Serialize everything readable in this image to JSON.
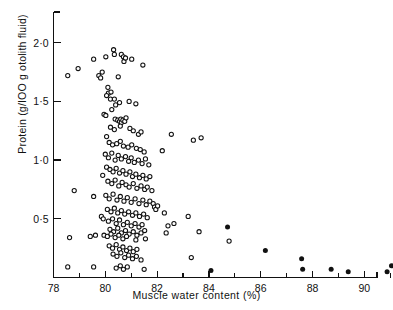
{
  "chart_data": {
    "type": "scatter",
    "title": "",
    "xlabel": "Muscle water content (%)",
    "ylabel": "Protein (g/IOO g otolith fluid)",
    "xlim": [
      78,
      91.3
    ],
    "ylim": [
      0.0,
      2.12
    ],
    "grid": false,
    "legend_position": "none",
    "xticks": [
      78,
      79,
      80,
      81,
      82,
      83,
      84,
      85,
      86,
      87,
      88,
      89,
      90,
      91
    ],
    "xticklabels": [
      "78",
      "",
      "80",
      "",
      "82",
      "",
      "84",
      "",
      "86",
      "",
      "88",
      "",
      "90",
      ""
    ],
    "yticks": [
      0.5,
      1.0,
      1.5,
      2.0
    ],
    "yticklabels": [
      "0·5",
      "1·0",
      "1·5",
      "2·0"
    ],
    "marker_colors": {
      "open": "#111111",
      "filled": "#111111",
      "axis": "#111111"
    },
    "series": [
      {
        "name": "open-circles",
        "marker": "open-circle",
        "points": [
          [
            78.55,
            1.72
          ],
          [
            78.95,
            1.78
          ],
          [
            79.55,
            1.86
          ],
          [
            79.75,
            1.72
          ],
          [
            79.82,
            1.7
          ],
          [
            79.88,
            1.75
          ],
          [
            80.02,
            1.88
          ],
          [
            80.1,
            1.62
          ],
          [
            80.32,
            1.94
          ],
          [
            80.35,
            1.9
          ],
          [
            80.5,
            1.71
          ],
          [
            80.62,
            1.9
          ],
          [
            80.7,
            1.88
          ],
          [
            80.72,
            1.84
          ],
          [
            80.78,
            1.87
          ],
          [
            81.02,
            1.86
          ],
          [
            81.45,
            1.81
          ],
          [
            80.12,
            1.57
          ],
          [
            80.22,
            1.58
          ],
          [
            80.2,
            1.52
          ],
          [
            80.05,
            1.55
          ],
          [
            80.35,
            1.52
          ],
          [
            80.4,
            1.47
          ],
          [
            80.55,
            1.49
          ],
          [
            80.92,
            1.5
          ],
          [
            81.18,
            1.48
          ],
          [
            79.95,
            1.39
          ],
          [
            80.02,
            1.38
          ],
          [
            80.25,
            1.43
          ],
          [
            80.38,
            1.35
          ],
          [
            80.48,
            1.34
          ],
          [
            80.55,
            1.33
          ],
          [
            80.6,
            1.35
          ],
          [
            80.62,
            1.32
          ],
          [
            80.68,
            1.34
          ],
          [
            80.75,
            1.33
          ],
          [
            80.8,
            1.36
          ],
          [
            80.2,
            1.28
          ],
          [
            80.35,
            1.26
          ],
          [
            80.58,
            1.29
          ],
          [
            80.95,
            1.27
          ],
          [
            81.08,
            1.25
          ],
          [
            81.28,
            1.22
          ],
          [
            81.38,
            1.24
          ],
          [
            82.55,
            1.22
          ],
          [
            83.4,
            1.17
          ],
          [
            83.7,
            1.19
          ],
          [
            80.05,
            1.2
          ],
          [
            80.15,
            1.15
          ],
          [
            80.28,
            1.13
          ],
          [
            80.44,
            1.14
          ],
          [
            80.58,
            1.16
          ],
          [
            80.7,
            1.12
          ],
          [
            80.88,
            1.11
          ],
          [
            81.02,
            1.13
          ],
          [
            81.2,
            1.1
          ],
          [
            81.35,
            1.09
          ],
          [
            81.5,
            1.07
          ],
          [
            82.2,
            1.08
          ],
          [
            80.0,
            1.05
          ],
          [
            80.12,
            1.02
          ],
          [
            80.25,
            1.06
          ],
          [
            80.38,
            1.0
          ],
          [
            80.5,
            1.04
          ],
          [
            80.62,
            1.01
          ],
          [
            80.78,
            1.03
          ],
          [
            80.9,
            0.99
          ],
          [
            81.0,
            1.02
          ],
          [
            81.12,
            0.98
          ],
          [
            81.28,
            1.0
          ],
          [
            81.42,
            0.97
          ],
          [
            81.55,
            1.01
          ],
          [
            81.68,
            0.96
          ],
          [
            80.05,
            0.94
          ],
          [
            80.18,
            0.92
          ],
          [
            80.3,
            0.9
          ],
          [
            80.42,
            0.93
          ],
          [
            80.55,
            0.89
          ],
          [
            80.68,
            0.91
          ],
          [
            80.8,
            0.88
          ],
          [
            80.95,
            0.9
          ],
          [
            81.05,
            0.86
          ],
          [
            81.18,
            0.88
          ],
          [
            81.32,
            0.85
          ],
          [
            81.45,
            0.87
          ],
          [
            81.58,
            0.84
          ],
          [
            81.72,
            0.86
          ],
          [
            79.9,
            0.87
          ],
          [
            80.1,
            0.82
          ],
          [
            80.25,
            0.8
          ],
          [
            80.38,
            0.83
          ],
          [
            80.52,
            0.78
          ],
          [
            80.65,
            0.81
          ],
          [
            80.8,
            0.79
          ],
          [
            80.92,
            0.77
          ],
          [
            81.08,
            0.8
          ],
          [
            81.22,
            0.76
          ],
          [
            81.38,
            0.78
          ],
          [
            81.52,
            0.75
          ],
          [
            81.62,
            0.77
          ],
          [
            81.8,
            0.74
          ],
          [
            78.8,
            0.74
          ],
          [
            79.55,
            0.69
          ],
          [
            80.02,
            0.7
          ],
          [
            80.15,
            0.67
          ],
          [
            80.3,
            0.71
          ],
          [
            80.45,
            0.66
          ],
          [
            80.58,
            0.69
          ],
          [
            80.72,
            0.65
          ],
          [
            80.85,
            0.68
          ],
          [
            81.0,
            0.64
          ],
          [
            81.15,
            0.67
          ],
          [
            81.3,
            0.63
          ],
          [
            81.45,
            0.66
          ],
          [
            81.58,
            0.62
          ],
          [
            81.72,
            0.65
          ],
          [
            81.85,
            0.63
          ],
          [
            81.9,
            0.6
          ],
          [
            81.95,
            0.58
          ],
          [
            82.02,
            0.61
          ],
          [
            80.08,
            0.58
          ],
          [
            80.22,
            0.56
          ],
          [
            80.35,
            0.59
          ],
          [
            80.48,
            0.55
          ],
          [
            80.62,
            0.57
          ],
          [
            80.75,
            0.54
          ],
          [
            80.9,
            0.56
          ],
          [
            81.05,
            0.53
          ],
          [
            81.18,
            0.55
          ],
          [
            81.32,
            0.52
          ],
          [
            81.48,
            0.54
          ],
          [
            81.62,
            0.51
          ],
          [
            82.28,
            0.55
          ],
          [
            79.85,
            0.52
          ],
          [
            79.92,
            0.5
          ],
          [
            80.12,
            0.48
          ],
          [
            80.28,
            0.5
          ],
          [
            80.42,
            0.46
          ],
          [
            80.55,
            0.49
          ],
          [
            80.7,
            0.45
          ],
          [
            80.85,
            0.47
          ],
          [
            81.0,
            0.44
          ],
          [
            81.15,
            0.46
          ],
          [
            81.3,
            0.43
          ],
          [
            81.42,
            0.45
          ],
          [
            82.42,
            0.44
          ],
          [
            82.65,
            0.46
          ],
          [
            83.2,
            0.52
          ],
          [
            80.18,
            0.41
          ],
          [
            80.32,
            0.39
          ],
          [
            80.48,
            0.42
          ],
          [
            80.62,
            0.38
          ],
          [
            80.78,
            0.4
          ],
          [
            80.92,
            0.37
          ],
          [
            81.08,
            0.39
          ],
          [
            81.22,
            0.36
          ],
          [
            81.38,
            0.38
          ],
          [
            81.52,
            0.4
          ],
          [
            82.35,
            0.38
          ],
          [
            83.62,
            0.39
          ],
          [
            78.62,
            0.34
          ],
          [
            79.42,
            0.35
          ],
          [
            79.62,
            0.36
          ],
          [
            79.95,
            0.36
          ],
          [
            80.08,
            0.35
          ],
          [
            80.22,
            0.37
          ],
          [
            80.38,
            0.34
          ],
          [
            80.52,
            0.36
          ],
          [
            80.68,
            0.33
          ],
          [
            80.82,
            0.35
          ],
          [
            81.18,
            0.32
          ],
          [
            81.55,
            0.33
          ],
          [
            84.78,
            0.31
          ],
          [
            80.15,
            0.27
          ],
          [
            80.28,
            0.25
          ],
          [
            80.42,
            0.28
          ],
          [
            80.55,
            0.24
          ],
          [
            80.68,
            0.26
          ],
          [
            80.82,
            0.23
          ],
          [
            80.95,
            0.25
          ],
          [
            81.08,
            0.22
          ],
          [
            81.22,
            0.24
          ],
          [
            80.3,
            0.2
          ],
          [
            80.45,
            0.18
          ],
          [
            80.6,
            0.21
          ],
          [
            80.75,
            0.17
          ],
          [
            80.9,
            0.19
          ],
          [
            81.05,
            0.16
          ],
          [
            81.2,
            0.18
          ],
          [
            81.38,
            0.15
          ],
          [
            83.32,
            0.17
          ],
          [
            78.55,
            0.09
          ],
          [
            79.55,
            0.09
          ],
          [
            80.42,
            0.08
          ],
          [
            80.58,
            0.1
          ],
          [
            80.7,
            0.07
          ],
          [
            80.85,
            0.09
          ],
          [
            81.5,
            0.07
          ]
        ]
      },
      {
        "name": "filled-circles",
        "marker": "filled-circle",
        "points": [
          [
            84.72,
            0.43
          ],
          [
            86.18,
            0.23
          ],
          [
            87.58,
            0.16
          ],
          [
            87.62,
            0.07
          ],
          [
            88.72,
            0.07
          ],
          [
            89.38,
            0.05
          ],
          [
            90.88,
            0.05
          ],
          [
            91.05,
            0.1
          ],
          [
            84.08,
            0.06
          ]
        ]
      }
    ]
  }
}
